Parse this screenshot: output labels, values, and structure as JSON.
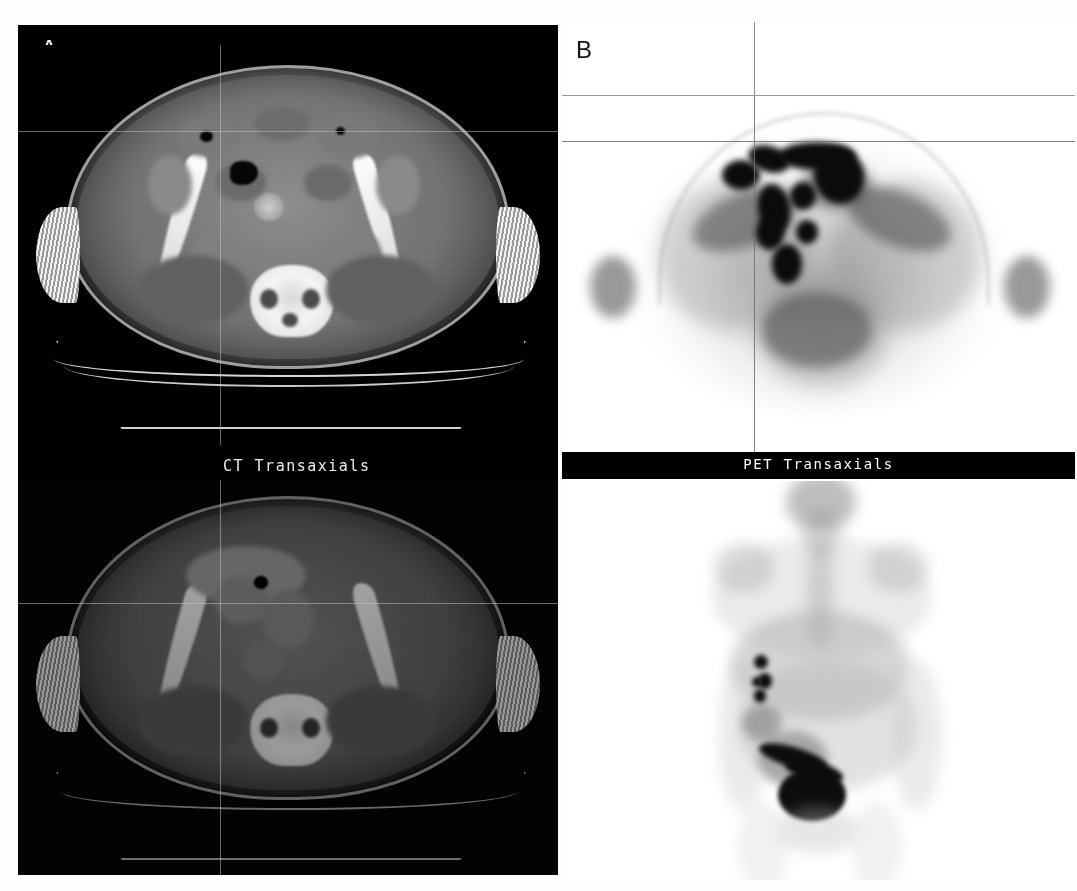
{
  "figure": {
    "type": "medical-imaging-figure",
    "modality": "PET/CT",
    "panels": [
      {
        "letter": "A",
        "label_text": "A",
        "background": "#000000",
        "views": [
          "CT transaxial (upper)",
          "CT transaxial fused window (lower)"
        ],
        "caption": "CT Transaxials",
        "zoom_label": "×1.40"
      },
      {
        "letter": "B",
        "label_text": "B",
        "background": "#ffffff",
        "views": [
          "PET transaxial (upper)",
          "PET whole-body MIP coronal (lower)"
        ],
        "caption": "PET Transaxials"
      }
    ]
  },
  "panelA": {
    "letter": "A",
    "caption": "CT Transaxials",
    "zoom_label": "×1.40",
    "crosshair": {
      "x": 220,
      "y": 126
    },
    "crosshair_lower": {
      "x": 220,
      "y": 578
    }
  },
  "panelB": {
    "letter": "B",
    "caption": "PET Transaxials",
    "crosshair": {
      "x": 753,
      "y": 117
    }
  },
  "colors": {
    "panelA_background": "#000000",
    "panelB_background": "#ffffff",
    "band_background": "#000000",
    "band_text": "#ffffff",
    "caption_text": "#ececec",
    "crosshair": "#bebebe",
    "hot_uptake": "#0b0b0b",
    "bone": "#f3f3f3"
  },
  "icons": {
    "crosshair": "crosshair-icon",
    "scale": "zoom-factor-icon"
  }
}
